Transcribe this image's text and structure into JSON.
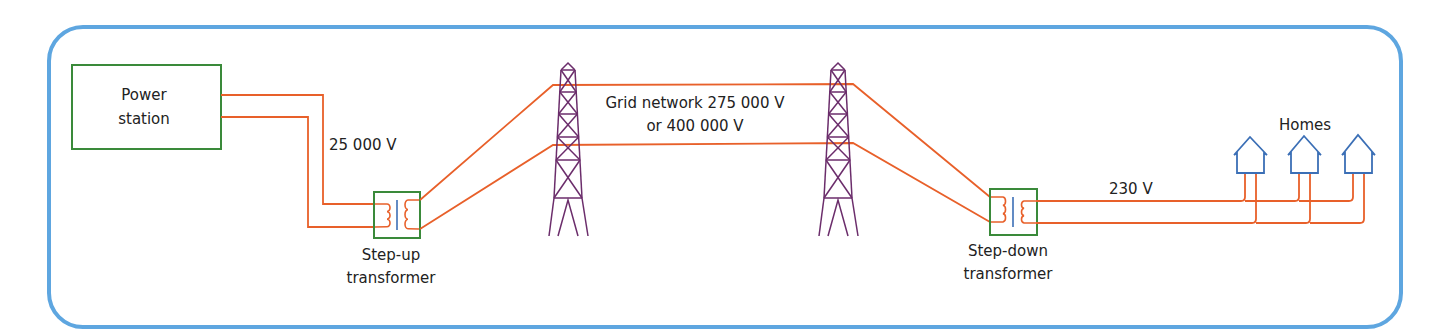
{
  "colors": {
    "frame": "#5ea6e0",
    "wire": "#e8602a",
    "box": "#3a8a3a",
    "tower": "#6b2d6b",
    "house": "#3b6fb6",
    "core": "#3b6fb6",
    "text": "#222222"
  },
  "labels": {
    "power_station_line1": "Power",
    "power_station_line2": "station",
    "voltage_generation": "25 000 V",
    "step_up_line1": "Step-up",
    "step_up_line2": "transformer",
    "grid_line1": "Grid network 275 000 V",
    "grid_line2": "or 400 000 V",
    "step_down_line1": "Step-down",
    "step_down_line2": "transformer",
    "voltage_homes": "230 V",
    "homes": "Homes"
  }
}
